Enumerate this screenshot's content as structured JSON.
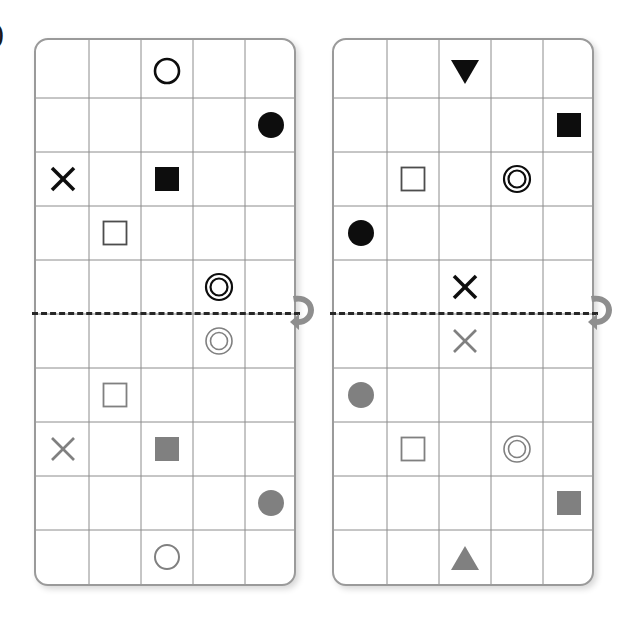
{
  "figure": {
    "label": ")"
  },
  "colors": {
    "panel_border": "#9a9a9a",
    "grid_line": "#8c8c8c",
    "shape_dark": "#0d0d0d",
    "shape_mirror": "#808080",
    "mirror_line": "#262626",
    "rotate_icon": "#8e8e8e",
    "background": "#ffffff"
  },
  "layout": {
    "grid_columns": 5,
    "grid_rows_half": 5,
    "panel_width": 262,
    "panel_height": 548,
    "cell_width": 52,
    "cell_height": 54
  },
  "panels": [
    {
      "name": "left-panel",
      "left": 34,
      "top": 38,
      "mirror_row_index": 5,
      "rotate_icon": "rotate-arrow-icon",
      "shapes": [
        {
          "id": "L1",
          "shape": "circle-outline",
          "row": 0,
          "col": 2,
          "color": "#0d0d0d",
          "mirrored": false
        },
        {
          "id": "L2",
          "shape": "circle-filled",
          "row": 1,
          "col": 4,
          "color": "#0d0d0d",
          "mirrored": false
        },
        {
          "id": "L3",
          "shape": "cross",
          "row": 2,
          "col": 0,
          "color": "#0d0d0d",
          "mirrored": false
        },
        {
          "id": "L4",
          "shape": "square-filled",
          "row": 2,
          "col": 2,
          "color": "#0d0d0d",
          "mirrored": false
        },
        {
          "id": "L5",
          "shape": "square-outline",
          "row": 3,
          "col": 1,
          "color": "#4d4d4d",
          "mirrored": false
        },
        {
          "id": "L6",
          "shape": "double-circle",
          "row": 4,
          "col": 3,
          "color": "#0d0d0d",
          "mirrored": false
        },
        {
          "id": "L6m",
          "shape": "double-circle",
          "row": 5,
          "col": 3,
          "color": "#808080",
          "mirrored": true
        },
        {
          "id": "L5m",
          "shape": "square-outline",
          "row": 6,
          "col": 1,
          "color": "#808080",
          "mirrored": true
        },
        {
          "id": "L3m",
          "shape": "cross",
          "row": 7,
          "col": 0,
          "color": "#808080",
          "mirrored": true
        },
        {
          "id": "L4m",
          "shape": "square-filled",
          "row": 7,
          "col": 2,
          "color": "#808080",
          "mirrored": true
        },
        {
          "id": "L2m",
          "shape": "circle-filled",
          "row": 8,
          "col": 4,
          "color": "#808080",
          "mirrored": true
        },
        {
          "id": "L1m",
          "shape": "circle-outline",
          "row": 9,
          "col": 2,
          "color": "#808080",
          "mirrored": true
        }
      ]
    },
    {
      "name": "right-panel",
      "left": 332,
      "top": 38,
      "mirror_row_index": 5,
      "rotate_icon": "rotate-arrow-icon",
      "shapes": [
        {
          "id": "R1",
          "shape": "triangle-down",
          "row": 0,
          "col": 2,
          "color": "#0d0d0d",
          "mirrored": false
        },
        {
          "id": "R2",
          "shape": "square-filled",
          "row": 1,
          "col": 4,
          "color": "#0d0d0d",
          "mirrored": false
        },
        {
          "id": "R3",
          "shape": "square-outline",
          "row": 2,
          "col": 1,
          "color": "#4d4d4d",
          "mirrored": false
        },
        {
          "id": "R4",
          "shape": "double-circle",
          "row": 2,
          "col": 3,
          "color": "#0d0d0d",
          "mirrored": false
        },
        {
          "id": "R5",
          "shape": "circle-filled",
          "row": 3,
          "col": 0,
          "color": "#0d0d0d",
          "mirrored": false
        },
        {
          "id": "R6",
          "shape": "cross",
          "row": 4,
          "col": 2,
          "color": "#0d0d0d",
          "mirrored": false
        },
        {
          "id": "R6m",
          "shape": "cross",
          "row": 5,
          "col": 2,
          "color": "#808080",
          "mirrored": true
        },
        {
          "id": "R5m",
          "shape": "circle-filled",
          "row": 6,
          "col": 0,
          "color": "#808080",
          "mirrored": true
        },
        {
          "id": "R3m",
          "shape": "square-outline",
          "row": 7,
          "col": 1,
          "color": "#808080",
          "mirrored": true
        },
        {
          "id": "R4m",
          "shape": "double-circle",
          "row": 7,
          "col": 3,
          "color": "#808080",
          "mirrored": true
        },
        {
          "id": "R2m",
          "shape": "square-filled",
          "row": 8,
          "col": 4,
          "color": "#808080",
          "mirrored": true
        },
        {
          "id": "R1m",
          "shape": "triangle-up",
          "row": 9,
          "col": 2,
          "color": "#808080",
          "mirrored": true
        }
      ]
    }
  ]
}
